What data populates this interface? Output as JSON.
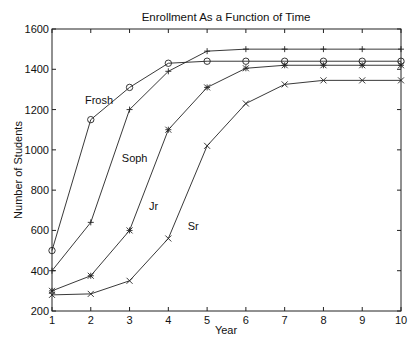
{
  "chart_data": {
    "type": "line",
    "title": "Enrollment As a Function of Time",
    "xlabel": "Year",
    "ylabel": "Number of Students",
    "x": [
      1,
      2,
      3,
      4,
      5,
      6,
      7,
      8,
      9,
      10
    ],
    "xlim": [
      1,
      10
    ],
    "ylim": [
      200,
      1600
    ],
    "xticks": [
      "1",
      "2",
      "3",
      "4",
      "5",
      "6",
      "7",
      "8",
      "9",
      "10"
    ],
    "yticks": [
      "200",
      "400",
      "600",
      "800",
      "1000",
      "1200",
      "1400",
      "1600"
    ],
    "grid": false,
    "legend": "inline text labels",
    "series": [
      {
        "name": "Frosh",
        "marker": "circle",
        "values": [
          500,
          1150,
          1310,
          1430,
          1440,
          1440,
          1440,
          1440,
          1440,
          1440
        ]
      },
      {
        "name": "Soph",
        "marker": "plus",
        "values": [
          400,
          640,
          1200,
          1390,
          1490,
          1500,
          1500,
          1500,
          1500,
          1500
        ]
      },
      {
        "name": "Jr",
        "marker": "star",
        "values": [
          300,
          375,
          600,
          1100,
          1310,
          1405,
          1420,
          1420,
          1420,
          1420
        ]
      },
      {
        "name": "Sr",
        "marker": "x",
        "values": [
          280,
          285,
          350,
          560,
          1020,
          1230,
          1325,
          1345,
          1345,
          1345
        ]
      }
    ],
    "annotations": [
      {
        "text": "Frosh",
        "x": 1.85,
        "y": 1230
      },
      {
        "text": "Soph",
        "x": 2.8,
        "y": 940
      },
      {
        "text": "Jr",
        "x": 3.5,
        "y": 700
      },
      {
        "text": "Sr",
        "x": 4.5,
        "y": 600
      }
    ]
  }
}
